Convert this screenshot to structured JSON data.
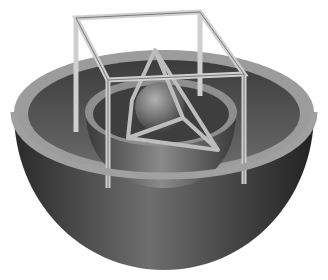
{
  "image": {
    "subject": "nested hemispheres with cube frame and tetrahedron",
    "colors": {
      "background": "#ffffff",
      "outer_shell_dark": "#2a2a2a",
      "outer_shell_mid": "#6a6a6a",
      "rim": "#9a9a9a",
      "inner_bowl": "#5a5a5a",
      "frame": "#c8c8c8",
      "sphere": "#7a7a7a"
    }
  }
}
